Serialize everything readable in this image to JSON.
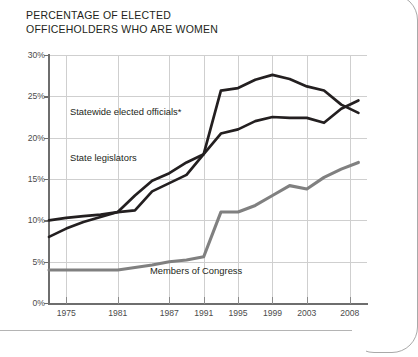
{
  "title": {
    "line1": "PERCENTAGE OF ELECTED",
    "line2": "OFFICEHOLDERS WHO ARE WOMEN"
  },
  "axis": {
    "y_ticks": [
      "0%",
      "5%",
      "10%",
      "15%",
      "20%",
      "25%",
      "30%"
    ],
    "x_ticks": [
      "1975",
      "1981",
      "1987",
      "1991",
      "1995",
      "1999",
      "2003",
      "2008"
    ]
  },
  "labels": {
    "statewide": "Statewide elected officials*",
    "legislators": "State legislators",
    "congress": "Members of Congress"
  },
  "colors": {
    "statewide": "#231f20",
    "legislators": "#231f20",
    "congress": "#808080",
    "grid": "#cfcfcf",
    "axis": "#6e6e6e"
  },
  "chart_data": {
    "type": "line",
    "title": "PERCENTAGE OF ELECTED OFFICEHOLDERS WHO ARE WOMEN",
    "xlabel": "",
    "ylabel": "",
    "ylim": [
      0,
      30
    ],
    "xlim": [
      1973,
      2010
    ],
    "grid": true,
    "legend": "inline-labels",
    "x_tick_labels": [
      "1975",
      "1981",
      "1987",
      "1991",
      "1995",
      "1999",
      "2003",
      "2008"
    ],
    "y_tick_labels": [
      "0%",
      "5%",
      "10%",
      "15%",
      "20%",
      "25%",
      "30%"
    ],
    "series": [
      {
        "name": "Statewide elected officials*",
        "color": "#231f20",
        "x": [
          1973,
          1975,
          1977,
          1979,
          1981,
          1983,
          1985,
          1987,
          1989,
          1991,
          1993,
          1995,
          1997,
          1999,
          2001,
          2003,
          2005,
          2007,
          2009
        ],
        "values": [
          10.0,
          10.3,
          10.5,
          10.7,
          11.0,
          11.2,
          13.5,
          14.5,
          15.5,
          18.0,
          25.7,
          26.0,
          27.0,
          27.6,
          27.1,
          26.2,
          25.7,
          24.0,
          23.0
        ]
      },
      {
        "name": "State legislators",
        "color": "#231f20",
        "x": [
          1973,
          1975,
          1977,
          1979,
          1981,
          1983,
          1985,
          1987,
          1989,
          1991,
          1993,
          1995,
          1997,
          1999,
          2001,
          2003,
          2005,
          2007,
          2009
        ],
        "values": [
          8.0,
          9.0,
          9.8,
          10.4,
          11.0,
          13.0,
          14.8,
          15.7,
          17.0,
          18.0,
          20.5,
          21.0,
          22.0,
          22.5,
          22.4,
          22.4,
          21.8,
          23.5,
          24.5
        ]
      },
      {
        "name": "Members of Congress",
        "color": "#808080",
        "x": [
          1973,
          1975,
          1977,
          1979,
          1981,
          1983,
          1985,
          1987,
          1989,
          1991,
          1993,
          1995,
          1997,
          1999,
          2001,
          2003,
          2005,
          2007,
          2009
        ],
        "values": [
          4.0,
          4.0,
          4.0,
          4.0,
          4.0,
          4.3,
          4.6,
          5.0,
          5.2,
          5.6,
          11.0,
          11.0,
          11.8,
          13.0,
          14.2,
          13.8,
          15.2,
          16.2,
          17.0
        ]
      }
    ]
  }
}
